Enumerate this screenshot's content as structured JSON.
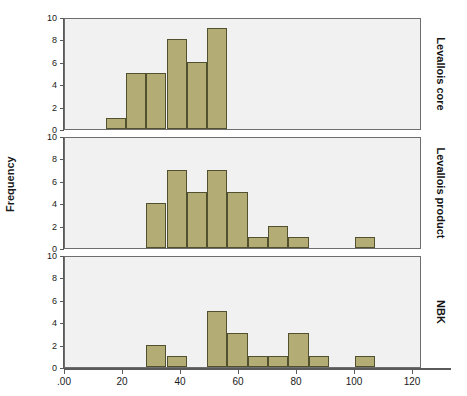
{
  "chart_data": {
    "type": "bar",
    "title": "",
    "subtitle": "",
    "xlabel": "",
    "ylabel": "Frequency",
    "ylim": [
      0,
      10
    ],
    "yticks": [
      0,
      2,
      4,
      6,
      8,
      10
    ],
    "ytick_labels": [
      "0",
      "2",
      "4",
      "6",
      "8",
      "10"
    ],
    "xlim": [
      -13,
      132
    ],
    "xticks": [
      0,
      20,
      40,
      60,
      80,
      100,
      120
    ],
    "xtick_labels": [
      ".00",
      "20",
      "40",
      "60",
      "80",
      "100",
      "120"
    ],
    "grid": false,
    "legend": null,
    "bin_width": 7,
    "panels": [
      {
        "label": "Levallois core",
        "bins": [
          {
            "x0": 14,
            "x1": 21,
            "count": 1
          },
          {
            "x0": 21,
            "x1": 28,
            "count": 5
          },
          {
            "x0": 28,
            "x1": 35,
            "count": 5
          },
          {
            "x0": 35,
            "x1": 42,
            "count": 8
          },
          {
            "x0": 42,
            "x1": 49,
            "count": 6
          },
          {
            "x0": 49,
            "x1": 56,
            "count": 9
          }
        ]
      },
      {
        "label": "Levallois product",
        "bins": [
          {
            "x0": 28,
            "x1": 35,
            "count": 4
          },
          {
            "x0": 35,
            "x1": 42,
            "count": 7
          },
          {
            "x0": 42,
            "x1": 49,
            "count": 5
          },
          {
            "x0": 49,
            "x1": 56,
            "count": 7
          },
          {
            "x0": 56,
            "x1": 63,
            "count": 5
          },
          {
            "x0": 63,
            "x1": 70,
            "count": 1
          },
          {
            "x0": 70,
            "x1": 77,
            "count": 2
          },
          {
            "x0": 77,
            "x1": 84,
            "count": 1
          },
          {
            "x0": 100,
            "x1": 107,
            "count": 1
          }
        ]
      },
      {
        "label": "NBK",
        "bins": [
          {
            "x0": 28,
            "x1": 35,
            "count": 2
          },
          {
            "x0": 35,
            "x1": 42,
            "count": 1
          },
          {
            "x0": 49,
            "x1": 56,
            "count": 5
          },
          {
            "x0": 56,
            "x1": 63,
            "count": 3
          },
          {
            "x0": 63,
            "x1": 70,
            "count": 1
          },
          {
            "x0": 70,
            "x1": 77,
            "count": 1
          },
          {
            "x0": 77,
            "x1": 84,
            "count": 3
          },
          {
            "x0": 84,
            "x1": 91,
            "count": 1
          },
          {
            "x0": 100,
            "x1": 107,
            "count": 1
          }
        ]
      }
    ],
    "colors": {
      "bar_fill": "#b3ad75",
      "bar_border": "#51502f",
      "panel_background": "#f1f1f1",
      "panel_border": "#6e6e6e",
      "axis": "#5a5a5a",
      "text": "#1a1a1a",
      "page_background": "#ffffff"
    }
  }
}
